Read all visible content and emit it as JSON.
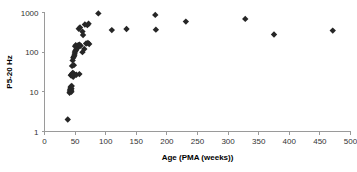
{
  "chart_data": {
    "type": "scatter",
    "title": "",
    "xlabel": "Age (PMA (weeks))",
    "ylabel": "P5-20 Hz",
    "xlim": [
      0,
      500
    ],
    "ylim": [
      1,
      1000
    ],
    "yscale": "log",
    "xscale": "linear",
    "grid": false,
    "legend": null,
    "xticks": [
      0,
      50,
      100,
      150,
      200,
      250,
      300,
      350,
      400,
      450,
      500
    ],
    "xtick_labels": [
      "0",
      "50",
      "100",
      "150",
      "200",
      "250",
      "300",
      "350",
      "400",
      "450",
      "500"
    ],
    "yticks": [
      1,
      10,
      100,
      1000
    ],
    "ytick_labels": [
      "1",
      "10",
      "100",
      "1000"
    ],
    "marker": "diamond",
    "marker_color": "#262626",
    "marker_size": 3.2,
    "points": [
      {
        "x": 38,
        "y": 2.0
      },
      {
        "x": 41,
        "y": 9.5
      },
      {
        "x": 41.5,
        "y": 10.5
      },
      {
        "x": 42,
        "y": 11.5
      },
      {
        "x": 42.5,
        "y": 12.5
      },
      {
        "x": 43,
        "y": 13.5
      },
      {
        "x": 43.5,
        "y": 11.0
      },
      {
        "x": 44,
        "y": 12.0
      },
      {
        "x": 44,
        "y": 10.0
      },
      {
        "x": 44.5,
        "y": 14.0
      },
      {
        "x": 43,
        "y": 26.0
      },
      {
        "x": 44,
        "y": 27.0
      },
      {
        "x": 45,
        "y": 28.0
      },
      {
        "x": 45.5,
        "y": 25.0
      },
      {
        "x": 46,
        "y": 30.0
      },
      {
        "x": 46.5,
        "y": 27.5
      },
      {
        "x": 47,
        "y": 24.0
      },
      {
        "x": 47.5,
        "y": 29.0
      },
      {
        "x": 48,
        "y": 26.5
      },
      {
        "x": 52,
        "y": 27.0
      },
      {
        "x": 57,
        "y": 28.0
      },
      {
        "x": 45,
        "y": 45.0
      },
      {
        "x": 48,
        "y": 47.0
      },
      {
        "x": 46,
        "y": 62.0
      },
      {
        "x": 47,
        "y": 72.0
      },
      {
        "x": 48,
        "y": 78.0
      },
      {
        "x": 49,
        "y": 85.0
      },
      {
        "x": 49.5,
        "y": 95.0
      },
      {
        "x": 50,
        "y": 105.0
      },
      {
        "x": 51,
        "y": 110.0
      },
      {
        "x": 52,
        "y": 118.0
      },
      {
        "x": 53,
        "y": 125.0
      },
      {
        "x": 54,
        "y": 130.0
      },
      {
        "x": 50,
        "y": 140.0
      },
      {
        "x": 51,
        "y": 150.0
      },
      {
        "x": 55,
        "y": 150.0
      },
      {
        "x": 57,
        "y": 155.0
      },
      {
        "x": 59,
        "y": 145.0
      },
      {
        "x": 62,
        "y": 100.0
      },
      {
        "x": 65,
        "y": 120.0
      },
      {
        "x": 68,
        "y": 165.0
      },
      {
        "x": 71,
        "y": 170.0
      },
      {
        "x": 73,
        "y": 160.0
      },
      {
        "x": 56,
        "y": 390.0
      },
      {
        "x": 58,
        "y": 420.0
      },
      {
        "x": 62,
        "y": 330.0
      },
      {
        "x": 63,
        "y": 270.0
      },
      {
        "x": 66,
        "y": 500.0
      },
      {
        "x": 70,
        "y": 480.0
      },
      {
        "x": 72,
        "y": 520.0
      },
      {
        "x": 88,
        "y": 950.0
      },
      {
        "x": 110,
        "y": 360.0
      },
      {
        "x": 134,
        "y": 385.0
      },
      {
        "x": 181,
        "y": 870.0
      },
      {
        "x": 182,
        "y": 370.0
      },
      {
        "x": 231,
        "y": 590.0
      },
      {
        "x": 328,
        "y": 690.0
      },
      {
        "x": 375,
        "y": 280.0
      },
      {
        "x": 471,
        "y": 350.0
      }
    ]
  },
  "axes": {
    "x_title": "Age (PMA (weeks))",
    "y_title": "P5-20 Hz"
  }
}
